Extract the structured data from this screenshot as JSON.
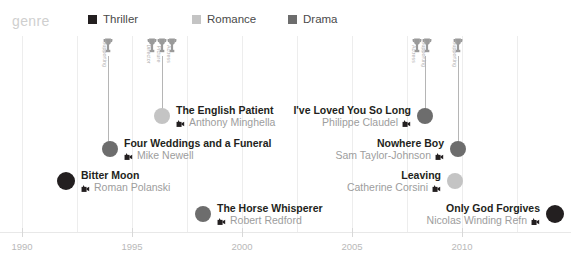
{
  "header": {
    "genre_label": "genre",
    "legend": [
      {
        "label": "Thriller",
        "color": "#231f20",
        "x": 0
      },
      {
        "label": "Romance",
        "color": "#c4c4c4",
        "x": 104
      },
      {
        "label": "Drama",
        "color": "#6d6d6d",
        "x": 200
      }
    ]
  },
  "axis": {
    "ticks": [
      {
        "label": "1990",
        "x": 22
      },
      {
        "label": "1995",
        "x": 132
      },
      {
        "label": "2000",
        "x": 242
      },
      {
        "label": "2005",
        "x": 352
      },
      {
        "label": "2010",
        "x": 462
      }
    ],
    "gridlines": [
      22,
      77,
      132,
      187,
      242,
      297,
      352,
      407,
      462,
      517
    ],
    "baseline_y": 232
  },
  "chart_data": {
    "type": "scatter",
    "title": "",
    "xlabel": "",
    "ylabel": "",
    "xlim": [
      1990,
      2013
    ],
    "legend_position": "top",
    "grid": true,
    "series": [
      {
        "name": "Thriller",
        "color": "#231f20",
        "points": [
          {
            "title": "Bitter Moon",
            "director": "Roman Polanski",
            "year": 1992,
            "side": "left",
            "x": 66,
            "y": 182,
            "r": 9
          },
          {
            "title": "Only God Forgives",
            "director": "Nicolas Winding Refn",
            "year": 2013,
            "side": "right",
            "x": 555,
            "y": 215,
            "r": 9
          }
        ]
      },
      {
        "name": "Romance",
        "color": "#c4c4c4",
        "points": [
          {
            "title": "The English Patient",
            "director": "Anthony Minghella",
            "year": 1996,
            "side": "left",
            "x": 162,
            "y": 117,
            "r": 8
          },
          {
            "title": "Leaving",
            "director": "Catherine Corsini",
            "year": 2009,
            "side": "right",
            "x": 455,
            "y": 182,
            "r": 8
          }
        ]
      },
      {
        "name": "Drama",
        "color": "#6d6d6d",
        "points": [
          {
            "title": "Four Weddings and a Funeral",
            "director": "Mike Newell",
            "year": 1994,
            "side": "left",
            "x": 110,
            "y": 150,
            "r": 8
          },
          {
            "title": "The Horse Whisperer",
            "director": "Robert Redford",
            "year": 1998,
            "side": "left",
            "x": 203,
            "y": 215,
            "r": 8
          },
          {
            "title": "I've Loved You So Long",
            "director": "Philippe Claudel",
            "year": 2008,
            "side": "right",
            "x": 425,
            "y": 117,
            "r": 8
          },
          {
            "title": "Nowhere Boy",
            "director": "Sam Taylor-Johnson",
            "year": 2009,
            "side": "right",
            "x": 458,
            "y": 150,
            "r": 8
          }
        ]
      }
    ],
    "awards": [
      {
        "film": "The English Patient",
        "stem_x": 108,
        "stem_top": 56,
        "stem_bottom": 150,
        "icons": [
          {
            "label": "Supporting",
            "x": 108
          }
        ]
      },
      {
        "film": "The English Patient",
        "stem_x": 162,
        "stem_top": 56,
        "stem_bottom": 117,
        "icons": [
          {
            "label": "Director",
            "x": 152
          },
          {
            "label": "Picture",
            "x": 162
          },
          {
            "label": "Actress",
            "x": 172
          }
        ]
      },
      {
        "film": "I've Loved You So Long",
        "stem_x": 425,
        "stem_top": 56,
        "stem_bottom": 117,
        "icons": [
          {
            "label": "Actress",
            "x": 417
          },
          {
            "label": "Supporting",
            "x": 427
          }
        ]
      },
      {
        "film": "Nowhere Boy",
        "stem_x": 458,
        "stem_top": 56,
        "stem_bottom": 150,
        "icons": [
          {
            "label": "Supporting",
            "x": 458
          }
        ]
      }
    ]
  }
}
